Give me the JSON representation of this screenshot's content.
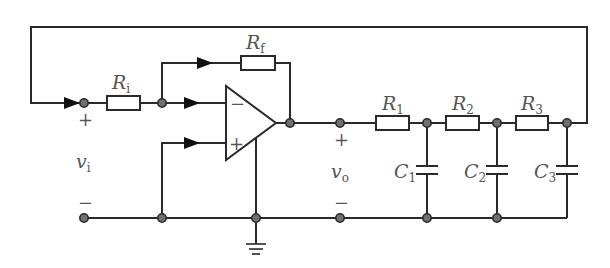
{
  "diagram": {
    "colors": {
      "wire": "#2a2a2a",
      "node": "#707070",
      "label": "#555555"
    },
    "labels": {
      "Ri": {
        "main": "R",
        "sub": "i"
      },
      "Rf": {
        "main": "R",
        "sub": "f"
      },
      "R1": {
        "main": "R",
        "sub": "1"
      },
      "R2": {
        "main": "R",
        "sub": "2"
      },
      "R3": {
        "main": "R",
        "sub": "3"
      },
      "C1": {
        "main": "C",
        "sub": "1"
      },
      "C2": {
        "main": "C",
        "sub": "2"
      },
      "C3": {
        "main": "C",
        "sub": "3"
      },
      "vi": {
        "main": "v",
        "sub": "i"
      },
      "vo": {
        "main": "v",
        "sub": "o"
      }
    },
    "signs": {
      "vi_plus": "+",
      "vi_minus": "−",
      "vo_plus": "+",
      "vo_minus": "−",
      "opamp_inverting": "−",
      "opamp_noninverting": "+"
    },
    "components": [
      {
        "id": "Ri",
        "type": "resistor"
      },
      {
        "id": "Rf",
        "type": "resistor"
      },
      {
        "id": "opamp",
        "type": "operational-amplifier"
      },
      {
        "id": "R1",
        "type": "resistor"
      },
      {
        "id": "R2",
        "type": "resistor"
      },
      {
        "id": "R3",
        "type": "resistor"
      },
      {
        "id": "C1",
        "type": "capacitor"
      },
      {
        "id": "C2",
        "type": "capacitor"
      },
      {
        "id": "C3",
        "type": "capacitor"
      },
      {
        "id": "ground",
        "type": "ground"
      }
    ]
  }
}
